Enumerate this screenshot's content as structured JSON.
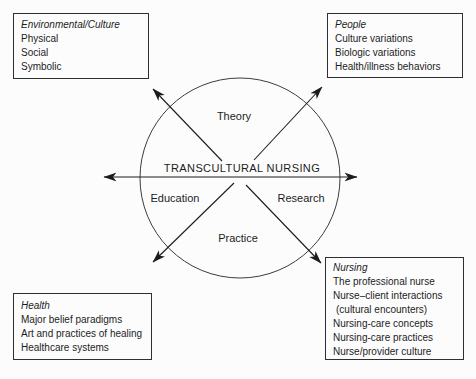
{
  "figure": {
    "center_title": "TRANSCULTURAL NURSING",
    "quadrants": {
      "top": "Theory",
      "left": "Education",
      "right": "Research",
      "bottom": "Practice"
    },
    "boxes": {
      "environment": {
        "title": "Environmental/Culture",
        "items": [
          "Physical",
          "Social",
          "Symbolic"
        ]
      },
      "people": {
        "title": "People",
        "items": [
          "Culture variations",
          "Biologic variations",
          "Health/illness behaviors"
        ]
      },
      "health": {
        "title": "Health",
        "items": [
          "Major belief paradigms",
          "Art and practices of healing",
          "Healthcare systems"
        ]
      },
      "nursing": {
        "title": "Nursing",
        "items": [
          "The professional nurse",
          "Nurse–client interactions",
          "(cultural encounters)",
          "Nursing-care concepts",
          "Nursing-care practices",
          "Nurse/provider culture"
        ]
      }
    },
    "colors": {
      "background": "#fcfcfc",
      "line": "#1c1c1c",
      "circle_stroke": "#3c3c3c",
      "box_border": "#2f2f2f",
      "text": "#1c1c1c"
    }
  }
}
